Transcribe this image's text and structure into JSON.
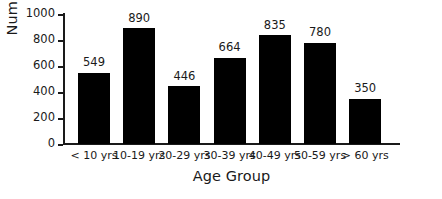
{
  "chart_data": {
    "type": "bar",
    "title": "",
    "xlabel": "Age Group",
    "ylabel": "Number",
    "categories": [
      "< 10 yrs",
      "10-19 yrs",
      "20-29 yrs",
      "30-39 yrs",
      "40-49 yrs",
      "50-59 yrs",
      "> 60 yrs"
    ],
    "values": [
      549,
      890,
      446,
      664,
      835,
      780,
      350
    ],
    "data_labels": [
      "549",
      "890",
      "446",
      "664",
      "835",
      "780",
      "350"
    ],
    "ylim": [
      0,
      1000
    ],
    "yticks": [
      0,
      200,
      400,
      600,
      800,
      1000
    ],
    "ytick_labels": [
      "0",
      "200",
      "400",
      "600",
      "800",
      "1000"
    ],
    "grid": false,
    "legend": false,
    "bar_color": "#000000",
    "axis_color": "#1a1a1a",
    "background_color": "#ffffff"
  }
}
